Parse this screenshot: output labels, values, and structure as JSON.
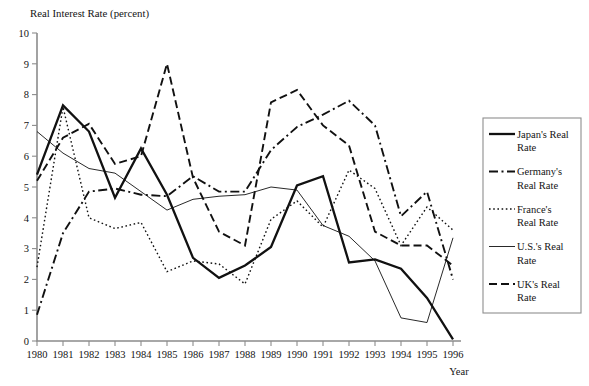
{
  "chart_data": {
    "type": "line",
    "title": "Real Interest Rate (percent)",
    "xlabel": "Year",
    "ylabel": "",
    "xlim": [
      1980,
      1996
    ],
    "ylim": [
      0,
      10
    ],
    "ytick_step": 1,
    "grid": false,
    "legend_position": "right-outside",
    "x": [
      1980,
      1981,
      1982,
      1983,
      1984,
      1985,
      1986,
      1987,
      1988,
      1989,
      1990,
      1991,
      1992,
      1993,
      1994,
      1995,
      1996
    ],
    "xticklabels": [
      "1980",
      "1981",
      "1982",
      "1983",
      "1984",
      "1985",
      "1986",
      "1987",
      "1988",
      "1989",
      "1990",
      "1991",
      "1992",
      "1993",
      "1994",
      "1995",
      "1996"
    ],
    "yticklabels": [
      "0",
      "1",
      "2",
      "3",
      "4",
      "5",
      "6",
      "7",
      "8",
      "9",
      "10"
    ],
    "series": [
      {
        "name": "Japan's Real Rate",
        "legend_label_line1": "Japan's Real",
        "legend_label_line2": "Rate",
        "style": "solid-thick",
        "values": [
          5.4,
          7.65,
          6.8,
          4.65,
          6.25,
          4.75,
          2.7,
          2.05,
          2.45,
          3.05,
          5.05,
          5.35,
          2.55,
          2.65,
          2.35,
          1.4,
          0.05
        ]
      },
      {
        "name": "Germany's Real Rate",
        "legend_label_line1": "Germany's",
        "legend_label_line2": "Real Rate",
        "style": "dash-dot",
        "values": [
          0.85,
          3.5,
          4.85,
          4.95,
          4.75,
          4.7,
          5.35,
          4.85,
          4.85,
          6.2,
          6.95,
          7.35,
          7.8,
          7.0,
          4.05,
          4.85,
          2.0
        ]
      },
      {
        "name": "France's Real Rate",
        "legend_label_line1": "France's",
        "legend_label_line2": "Real Rate",
        "style": "dotted",
        "values": [
          2.4,
          7.6,
          4.0,
          3.65,
          3.85,
          2.25,
          2.6,
          2.5,
          1.85,
          3.95,
          4.55,
          3.7,
          5.55,
          4.95,
          3.1,
          4.35,
          3.6
        ]
      },
      {
        "name": "U.S.'s Real Rate",
        "legend_label_line1": "U.S.'s Real",
        "legend_label_line2": "Rate",
        "style": "solid-thin",
        "values": [
          6.8,
          6.1,
          5.6,
          5.45,
          4.85,
          4.25,
          4.6,
          4.7,
          4.75,
          5.0,
          4.9,
          3.75,
          3.4,
          2.6,
          0.75,
          0.6,
          3.35
        ]
      },
      {
        "name": "UK's Real Rate",
        "legend_label_line1": "UK's Real",
        "legend_label_line2": "Rate",
        "style": "dashed",
        "values": [
          5.2,
          6.6,
          7.05,
          5.75,
          6.0,
          9.0,
          5.3,
          3.55,
          3.1,
          7.75,
          8.15,
          7.0,
          6.35,
          3.55,
          3.1,
          3.1,
          2.45
        ]
      }
    ]
  },
  "colors": {
    "line": "#111111",
    "axis": "#8c8c8c",
    "text": "#141414",
    "background": "#ffffff"
  }
}
